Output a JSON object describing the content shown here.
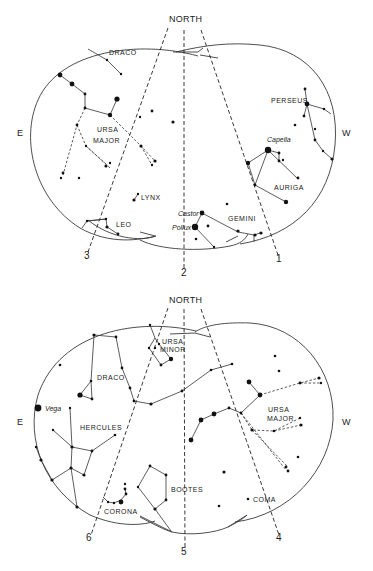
{
  "charts": [
    {
      "id": "top",
      "north_label": "NORTH",
      "east_label": "E",
      "west_label": "W",
      "guide_lines": [
        {
          "number": "1"
        },
        {
          "number": "2"
        },
        {
          "number": "3"
        }
      ],
      "constellations": {
        "draco": "DRACO",
        "ursa_major_1": "URSA",
        "ursa_major_2": "MAJOR",
        "lynx": "LYNX",
        "leo": "LEO",
        "gemini": "GEMINI",
        "perseus": "PERSEUS",
        "auriga": "AURIGA"
      },
      "stars": {
        "capella": "Capella",
        "castor": "Castor",
        "pollux": "Pollux"
      }
    },
    {
      "id": "bottom",
      "north_label": "NORTH",
      "east_label": "E",
      "west_label": "W",
      "guide_lines": [
        {
          "number": "4"
        },
        {
          "number": "5"
        },
        {
          "number": "6"
        }
      ],
      "constellations": {
        "ursa_minor_1": "URSA",
        "ursa_minor_2": "MINOR",
        "draco": "DRACO",
        "hercules": "HERCULES",
        "ursa_major_1": "URSA",
        "ursa_major_2": "MAJOR",
        "bootes": "BOOTES",
        "corona": "CORONA",
        "coma": "COMA"
      },
      "stars": {
        "vega": "Vega"
      }
    }
  ],
  "colors": {
    "background": "#ffffff",
    "ink": "#111111"
  }
}
